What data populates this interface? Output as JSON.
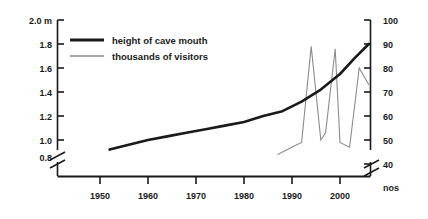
{
  "chart_data": {
    "type": "line",
    "title": "",
    "xlabel": "",
    "ylabel": "",
    "grid": false,
    "legend_position": "top-left-inside",
    "x_axis": {
      "tick_labels": [
        "1950",
        "1960",
        "1970",
        "1980",
        "1990",
        "2000"
      ],
      "tick_values": [
        1950,
        1960,
        1970,
        1980,
        1990,
        2000
      ],
      "xlim": [
        1943,
        2008
      ],
      "broken_axis": true
    },
    "y_axis_left": {
      "unit_label": "2.0 m",
      "tick_labels": [
        "2.0 m",
        "1.8",
        "1.6",
        "1.4",
        "1.2",
        "1.0",
        "0.8"
      ],
      "tick_values": [
        2.0,
        1.8,
        1.6,
        1.4,
        1.2,
        1.0,
        0.8
      ],
      "ylim": [
        0.8,
        2.0
      ],
      "broken_axis": true
    },
    "y_axis_right": {
      "unit_label": "nos",
      "tick_labels": [
        "100",
        "90",
        "80",
        "70",
        "60",
        "50",
        "40"
      ],
      "tick_values": [
        100,
        90,
        80,
        70,
        60,
        50,
        40
      ],
      "ylim": [
        40,
        100
      ],
      "broken_axis": true
    },
    "series": [
      {
        "name": "height of cave mouth",
        "color": "#1a1a1a",
        "width": 2.6,
        "axis": "left",
        "unit": "m",
        "x": [
          1952,
          1956,
          1960,
          1964,
          1968,
          1972,
          1976,
          1980,
          1984,
          1988,
          1992,
          1996,
          2000,
          2003,
          2006
        ],
        "y": [
          0.92,
          0.96,
          1.0,
          1.03,
          1.06,
          1.09,
          1.12,
          1.15,
          1.2,
          1.24,
          1.32,
          1.42,
          1.55,
          1.68,
          1.8
        ]
      },
      {
        "name": "thousands of visitors",
        "color": "#8c8c8c",
        "width": 1.1,
        "axis": "right",
        "unit": "thousands",
        "x": [
          1987,
          1991,
          1992,
          1994,
          1996,
          1997,
          1999,
          2000,
          2002,
          2004,
          2006
        ],
        "y": [
          44,
          48,
          49,
          89,
          50,
          53,
          88,
          49,
          47,
          80,
          73
        ]
      }
    ]
  },
  "legend": {
    "entries": [
      {
        "label": "height of cave mouth",
        "color": "#1a1a1a",
        "thickness": "thick"
      },
      {
        "label": "thousands of visitors",
        "color": "#8c8c8c",
        "thickness": "thin"
      }
    ]
  }
}
